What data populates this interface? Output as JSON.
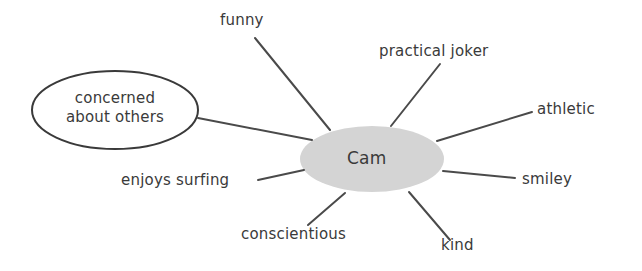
{
  "diagram": {
    "type": "mind-map",
    "center": {
      "label": "Cam",
      "fill": "#d4d4d4"
    },
    "line_color": "#4a4a4a",
    "text_color": "#3a3a3a",
    "nodes": [
      {
        "id": "funny",
        "label": "funny"
      },
      {
        "id": "practical-joker",
        "label": "practical joker"
      },
      {
        "id": "athletic",
        "label": "athletic"
      },
      {
        "id": "smiley",
        "label": "smiley"
      },
      {
        "id": "kind",
        "label": "kind"
      },
      {
        "id": "conscientious",
        "label": "conscientious"
      },
      {
        "id": "enjoys-surfing",
        "label": "enjoys surfing"
      },
      {
        "id": "concerned-about-others",
        "label_line1": "concerned",
        "label_line2": "about others",
        "highlighted": true
      }
    ]
  }
}
